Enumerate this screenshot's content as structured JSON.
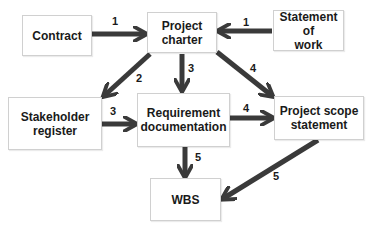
{
  "diagram": {
    "nodes": [
      {
        "id": "contract",
        "label": "Contract"
      },
      {
        "id": "project_charter",
        "label": "Project\ncharter"
      },
      {
        "id": "statement_of_work",
        "label": "Statement of\nwork"
      },
      {
        "id": "stakeholder_register",
        "label": "Stakeholder\nregister"
      },
      {
        "id": "requirement_documentation",
        "label": "Requirement\ndocumentation"
      },
      {
        "id": "project_scope_statement",
        "label": "Project scope\nstatement"
      },
      {
        "id": "wbs",
        "label": "WBS"
      }
    ],
    "edges": [
      {
        "from": "contract",
        "to": "project_charter",
        "label": "1"
      },
      {
        "from": "statement_of_work",
        "to": "project_charter",
        "label": "1"
      },
      {
        "from": "project_charter",
        "to": "stakeholder_register",
        "label": "2"
      },
      {
        "from": "project_charter",
        "to": "requirement_documentation",
        "label": "3"
      },
      {
        "from": "stakeholder_register",
        "to": "requirement_documentation",
        "label": "3"
      },
      {
        "from": "project_charter",
        "to": "project_scope_statement",
        "label": "4"
      },
      {
        "from": "requirement_documentation",
        "to": "project_scope_statement",
        "label": "4"
      },
      {
        "from": "requirement_documentation",
        "to": "wbs",
        "label": "5"
      },
      {
        "from": "project_scope_statement",
        "to": "wbs",
        "label": "5"
      }
    ],
    "colors": {
      "arrow": "#3a3a3a",
      "box_border": "#d0d0d0",
      "text": "#1a1a1a"
    }
  }
}
